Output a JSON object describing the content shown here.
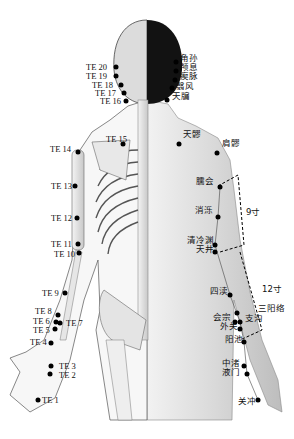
{
  "figure": {
    "measurements": {
      "upper_arm": "9寸",
      "forearm": "12寸"
    },
    "left_labels": [
      {
        "id": "TE 20",
        "x": 86,
        "y": 67,
        "dx": 116,
        "dy": 67
      },
      {
        "id": "TE 19",
        "x": 86,
        "y": 76,
        "dx": 116,
        "dy": 76
      },
      {
        "id": "TE 18",
        "x": 92,
        "y": 85,
        "dx": 121,
        "dy": 85
      },
      {
        "id": "TE 17",
        "x": 95,
        "y": 93,
        "dx": 124,
        "dy": 93
      },
      {
        "id": "TE 16",
        "x": 100,
        "y": 101,
        "dx": 126,
        "dy": 101
      },
      {
        "id": "TE 15",
        "x": 106,
        "y": 139,
        "dx": 123,
        "dy": 144
      },
      {
        "id": "TE 14",
        "x": 50,
        "y": 149,
        "dx": 78,
        "dy": 152
      },
      {
        "id": "TE 13",
        "x": 51,
        "y": 186,
        "dx": 75,
        "dy": 186
      },
      {
        "id": "TE 12",
        "x": 51,
        "y": 218,
        "dx": 77,
        "dy": 218
      },
      {
        "id": "TE 11",
        "x": 51,
        "y": 244,
        "dx": 78,
        "dy": 244
      },
      {
        "id": "TE 10",
        "x": 54,
        "y": 254,
        "dx": 79,
        "dy": 253
      },
      {
        "id": "TE 9",
        "x": 42,
        "y": 293,
        "dx": 65,
        "dy": 293
      },
      {
        "id": "TE 8",
        "x": 35,
        "y": 311,
        "dx": 58,
        "dy": 315
      },
      {
        "id": "TE 6",
        "x": 33,
        "y": 321,
        "dx": 56,
        "dy": 322
      },
      {
        "id": "TE 7",
        "x": 66,
        "y": 323,
        "dx": 60,
        "dy": 323
      },
      {
        "id": "TE 5",
        "x": 33,
        "y": 330,
        "dx": 55,
        "dy": 329
      },
      {
        "id": "TE 4",
        "x": 30,
        "y": 342,
        "dx": 51,
        "dy": 343
      },
      {
        "id": "TE 3",
        "x": 59,
        "y": 366,
        "dx": 51,
        "dy": 366
      },
      {
        "id": "TE 2",
        "x": 59,
        "y": 375,
        "dx": 50,
        "dy": 374
      },
      {
        "id": "TE 1",
        "x": 42,
        "y": 400,
        "dx": 38,
        "dy": 400
      }
    ],
    "right_labels": [
      {
        "name": "角孙",
        "x": 180,
        "y": 58,
        "dx": 176,
        "dy": 62
      },
      {
        "name": "颅息",
        "x": 180,
        "y": 67,
        "dx": 176,
        "dy": 71
      },
      {
        "name": "瘈脉",
        "x": 180,
        "y": 76,
        "dx": 175,
        "dy": 80
      },
      {
        "name": "翳风",
        "x": 176,
        "y": 86,
        "dx": 172,
        "dy": 88
      },
      {
        "name": "天牖",
        "x": 172,
        "y": 96,
        "dx": 167,
        "dy": 100
      },
      {
        "name": "天髎",
        "x": 183,
        "y": 134,
        "dx": 179,
        "dy": 144
      },
      {
        "name": "肩髎",
        "x": 222,
        "y": 143,
        "dx": 217,
        "dy": 153
      },
      {
        "name": "臑会",
        "x": 196,
        "y": 181,
        "dx": 220,
        "dy": 187
      },
      {
        "name": "消泺",
        "x": 195,
        "y": 210,
        "dx": 218,
        "dy": 217
      },
      {
        "name": "清冷渊",
        "x": 187,
        "y": 240,
        "dx": 215,
        "dy": 245
      },
      {
        "name": "天井",
        "x": 196,
        "y": 249,
        "dx": 215,
        "dy": 252
      },
      {
        "name": "四渎",
        "x": 210,
        "y": 291,
        "dx": 230,
        "dy": 295
      },
      {
        "name": "三阳络",
        "x": 258,
        "y": 308,
        "dx": 237,
        "dy": 313
      },
      {
        "name": "会宗",
        "x": 213,
        "y": 317,
        "dx": 235,
        "dy": 322
      },
      {
        "name": "支沟",
        "x": 245,
        "y": 318,
        "dx": 240,
        "dy": 322
      },
      {
        "name": "外关",
        "x": 220,
        "y": 326,
        "dx": 240,
        "dy": 329
      },
      {
        "name": "阳池",
        "x": 225,
        "y": 339,
        "dx": 244,
        "dy": 342
      },
      {
        "name": "中渚",
        "x": 222,
        "y": 363,
        "dx": 244,
        "dy": 366
      },
      {
        "name": "液门",
        "x": 222,
        "y": 372,
        "dx": 247,
        "dy": 374
      },
      {
        "name": "关冲",
        "x": 238,
        "y": 401,
        "dx": 258,
        "dy": 400
      }
    ]
  }
}
